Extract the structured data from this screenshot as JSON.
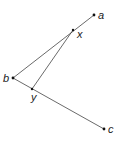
{
  "diagram": {
    "points": [
      {
        "id": "a",
        "label": "a",
        "x": 94,
        "y": 15,
        "lx": 98,
        "ly": 19
      },
      {
        "id": "x",
        "label": "x",
        "x": 73,
        "y": 30,
        "lx": 77,
        "ly": 38
      },
      {
        "id": "b",
        "label": "b",
        "x": 13,
        "y": 78,
        "lx": 3,
        "ly": 82
      },
      {
        "id": "y",
        "label": "y",
        "x": 32,
        "y": 89,
        "lx": 31,
        "ly": 101
      },
      {
        "id": "c",
        "label": "c",
        "x": 104,
        "y": 129,
        "lx": 108,
        "ly": 133
      }
    ],
    "segments": [
      {
        "from": "a",
        "to": "b"
      },
      {
        "from": "b",
        "to": "c"
      },
      {
        "from": "x",
        "to": "y"
      }
    ],
    "colors": {
      "line": "#444444",
      "point": "#111111",
      "label": "#222222"
    }
  }
}
